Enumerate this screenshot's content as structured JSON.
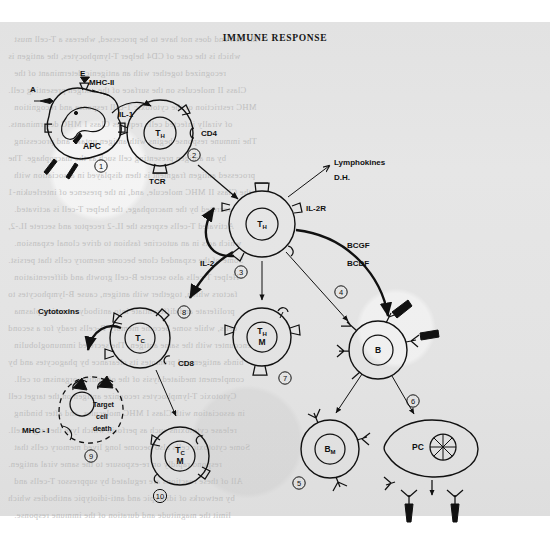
{
  "page": {
    "title": "IMMUNE RESPONSE",
    "background_color": "#e3e3e3",
    "ink_color": "#111111"
  },
  "ghost_text": [
    "the cell and does not have to be processed, whereas a T-cell must",
    "which is the case of CD4 helper T-lymphocytes, the antigen is",
    "recognized together with an antigenic determinant of the",
    "Class II molecules on the surface of the antigen presenting cell.",
    "MHC restriction of the cytotoxic T-cell response and recognition",
    "of virally infected cells requires Class I MHC determinants.",
    "The immune response begins with antigen uptake and processing",
    "by an antigen presenting cell such as the macrophage. The",
    "processed antigen fragment is then displayed in association with",
    "the Class II MHC molecule, and, in the presence of interleukin-1",
    "secreted by the macrophage, the helper T-cell is activated.",
    "Activated T-cells express the IL-2 receptor and secrete IL-2,",
    "which acts in an autocrine fashion to drive clonal expansion.",
    "Some of the expanded clone become memory cells that persist.",
    "Helper T-cells also secrete B-cell growth and differentiation",
    "factors which, together with antigen, cause B-lymphocytes to",
    "proliferate and differentiate into antibody secreting plasma",
    "cells, while some become memory B-cells ready for a second",
    "encounter with the same antigen. The secreted immunoglobulin",
    "binds antigen and promotes its clearance by phagocytes and by",
    "complement mediated lysis of the offending organism or cell.",
    "Cytotoxic T-lymphocytes recognize antigen on the target cell",
    "in association with Class I MHC molecules, and after binding",
    "release cytotoxins such as perforin which lyse the target cell.",
    "Some cytotoxic cells also become long lived memory cells that",
    "respond rapidly on re-exposure to the same viral antigen.",
    "All of these reactions are regulated by suppressor T-cells and",
    "by networks of idiotypic and anti-idiotypic antibodies which",
    "limit the magnitude and duration of the immune response."
  ],
  "labels": {
    "antigen": "A",
    "epitope": "E",
    "mhc_ii": "MHC-II",
    "il_1": "IL-1",
    "apc": "APC",
    "tcr": "TCR",
    "cd4": "CD4",
    "th": "T",
    "th_sub": "H",
    "il_2r": "IL-2R",
    "il_2": "IL-2",
    "lymphokines": "Lymphokines",
    "dh": "D.H.",
    "bcgf": "BCGF",
    "bcdf": "BCDF",
    "cytotoxins": "Cytotoxins",
    "tc": "T",
    "tc_sub": "C",
    "cd8": "CD8",
    "mhc_i": "MHC - I",
    "target_line1": "Target",
    "target_line2": "cell",
    "target_line3": "death",
    "memory_m": "M",
    "b": "B",
    "b_memory": "B",
    "b_memory_sub": "M",
    "pc": "PC"
  },
  "cells": [
    {
      "id": "apc",
      "name": "APC",
      "step": "1",
      "kind": "antigen-presenting-cell"
    },
    {
      "id": "th1",
      "name": "TH",
      "step": "2",
      "kind": "helper-t-cell"
    },
    {
      "id": "th2",
      "name": "TH",
      "step": "3",
      "kind": "activated-helper-t-cell"
    },
    {
      "id": "b",
      "name": "B",
      "step": "4",
      "kind": "b-lymphocyte"
    },
    {
      "id": "bm",
      "name": "BM",
      "step": "5",
      "kind": "memory-b-cell"
    },
    {
      "id": "pc",
      "name": "PC",
      "step": "6",
      "kind": "plasma-cell"
    },
    {
      "id": "thm",
      "name": "THM",
      "step": "7",
      "kind": "memory-helper-t-cell"
    },
    {
      "id": "tc",
      "name": "TC",
      "step": "8",
      "kind": "cytotoxic-t-cell"
    },
    {
      "id": "target",
      "name": "Target cell death",
      "step": "9",
      "kind": "target-cell"
    },
    {
      "id": "tcm",
      "name": "TCM",
      "step": "10",
      "kind": "memory-cytotoxic-t-cell"
    }
  ],
  "steps": {
    "s1": "①",
    "s2": "②",
    "s3": "③",
    "s4": "④",
    "s5": "⑤",
    "s6": "⑥",
    "s7": "⑦",
    "s8": "⑧",
    "s9": "⑨",
    "s10": "⑩"
  },
  "chart_data": {
    "type": "diagram",
    "title": "IMMUNE RESPONSE",
    "nodes": [
      {
        "id": "apc",
        "label": "APC",
        "step": 1,
        "x": 78,
        "y": 130
      },
      {
        "id": "th1",
        "label": "TH",
        "step": 2,
        "x": 160,
        "y": 133
      },
      {
        "id": "th2",
        "label": "TH",
        "step": 3,
        "x": 262,
        "y": 224
      },
      {
        "id": "b",
        "label": "B",
        "step": 4,
        "x": 378,
        "y": 350
      },
      {
        "id": "bm",
        "label": "BM",
        "step": 5,
        "x": 330,
        "y": 449
      },
      {
        "id": "pc",
        "label": "PC",
        "step": 6,
        "x": 432,
        "y": 447
      },
      {
        "id": "thm",
        "label": "TH M",
        "step": 7,
        "x": 262,
        "y": 337
      },
      {
        "id": "tc",
        "label": "TC",
        "step": 8,
        "x": 140,
        "y": 338
      },
      {
        "id": "target",
        "label": "Target cell death",
        "step": 9,
        "x": 85,
        "y": 415
      },
      {
        "id": "tcm",
        "label": "TC M",
        "step": 10,
        "x": 180,
        "y": 456
      }
    ],
    "edges": [
      {
        "from": "apc",
        "to": "th1",
        "label": "IL-1"
      },
      {
        "from": "th1",
        "to": "th2",
        "label": ""
      },
      {
        "from": "th2",
        "to": "th2",
        "label": "IL-2"
      },
      {
        "from": "th2",
        "to": "lymphokines",
        "label": "Lymphokines / D.H."
      },
      {
        "from": "th2",
        "to": "b",
        "label": "BCGF / BCDF"
      },
      {
        "from": "th2",
        "to": "thm",
        "label": ""
      },
      {
        "from": "th2",
        "to": "tc",
        "label": ""
      },
      {
        "from": "tc",
        "to": "target",
        "label": "Cytotoxins"
      },
      {
        "from": "tc",
        "to": "tcm",
        "label": ""
      },
      {
        "from": "b",
        "to": "bm",
        "label": ""
      },
      {
        "from": "b",
        "to": "pc",
        "label": ""
      },
      {
        "from": "pc",
        "to": "antibody",
        "label": ""
      }
    ]
  }
}
